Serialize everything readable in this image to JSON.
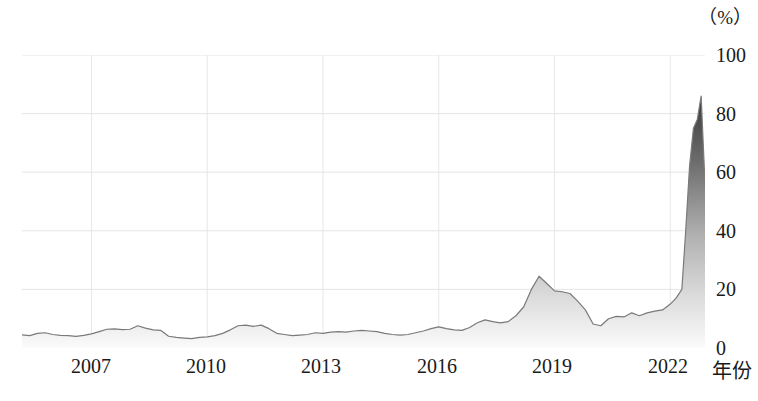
{
  "chart_data": {
    "type": "area",
    "title": "",
    "xlabel": "年份",
    "ylabel": "",
    "unit_label": "（%）",
    "xlim": [
      2005.2,
      2022.9
    ],
    "ylim": [
      0,
      100
    ],
    "grid": true,
    "legend": "none",
    "xticks": [
      2007,
      2010,
      2013,
      2016,
      2019,
      2022
    ],
    "xtick_labels": [
      "2007",
      "2010",
      "2013",
      "2016",
      "2019",
      "2022"
    ],
    "yticks": [
      0,
      20,
      40,
      60,
      80,
      100
    ],
    "ytick_labels": [
      "0",
      "20",
      "40",
      "60",
      "80",
      "100"
    ],
    "series": [
      {
        "name": "series-1",
        "line_color": "#6e6e6e",
        "fill_gradient_top": "#3a3a3a",
        "fill_gradient_bottom": "#fafafa",
        "x": [
          2005.2,
          2005.4,
          2005.6,
          2005.8,
          2006.0,
          2006.2,
          2006.4,
          2006.6,
          2006.8,
          2007.0,
          2007.2,
          2007.4,
          2007.6,
          2007.8,
          2008.0,
          2008.2,
          2008.4,
          2008.6,
          2008.8,
          2009.0,
          2009.2,
          2009.4,
          2009.6,
          2009.8,
          2010.0,
          2010.2,
          2010.4,
          2010.6,
          2010.8,
          2011.0,
          2011.2,
          2011.4,
          2011.6,
          2011.8,
          2012.0,
          2012.2,
          2012.4,
          2012.6,
          2012.8,
          2013.0,
          2013.2,
          2013.4,
          2013.6,
          2013.8,
          2014.0,
          2014.2,
          2014.4,
          2014.6,
          2014.8,
          2015.0,
          2015.2,
          2015.4,
          2015.6,
          2015.8,
          2016.0,
          2016.2,
          2016.4,
          2016.6,
          2016.8,
          2017.0,
          2017.2,
          2017.4,
          2017.6,
          2017.8,
          2018.0,
          2018.2,
          2018.4,
          2018.6,
          2018.8,
          2019.0,
          2019.2,
          2019.4,
          2019.6,
          2019.8,
          2020.0,
          2020.2,
          2020.4,
          2020.6,
          2020.8,
          2021.0,
          2021.2,
          2021.4,
          2021.6,
          2021.8,
          2022.0,
          2022.15,
          2022.3,
          2022.4,
          2022.5,
          2022.6,
          2022.7,
          2022.8,
          2022.9
        ],
        "y": [
          4.5,
          4.2,
          5.0,
          5.2,
          4.6,
          4.3,
          4.2,
          4.0,
          4.3,
          4.8,
          5.6,
          6.4,
          6.5,
          6.3,
          6.4,
          7.6,
          6.8,
          6.2,
          6.0,
          4.0,
          3.6,
          3.4,
          3.2,
          3.6,
          3.8,
          4.2,
          5.0,
          6.2,
          7.6,
          7.8,
          7.4,
          7.8,
          6.6,
          5.0,
          4.6,
          4.2,
          4.4,
          4.6,
          5.2,
          5.0,
          5.4,
          5.6,
          5.4,
          5.8,
          6.0,
          5.8,
          5.6,
          5.0,
          4.6,
          4.4,
          4.6,
          5.2,
          5.8,
          6.6,
          7.2,
          6.6,
          6.2,
          6.0,
          7.0,
          8.6,
          9.6,
          9.0,
          8.6,
          9.0,
          11.0,
          14.0,
          20.0,
          24.5,
          22.0,
          19.5,
          19.2,
          18.6,
          16.0,
          13.0,
          8.2,
          7.6,
          10.0,
          10.8,
          10.6,
          12.0,
          11.0,
          12.0,
          12.6,
          13.0,
          15.0,
          17.0,
          20.0,
          40.0,
          62.0,
          75.0,
          78.0,
          86.0,
          56.0
        ]
      }
    ]
  }
}
